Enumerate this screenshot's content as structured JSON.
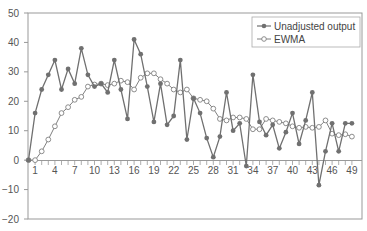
{
  "chart_data": {
    "type": "line",
    "title": "",
    "xlabel": "",
    "ylabel": "",
    "ylim": [
      -20,
      50
    ],
    "xlim": [
      0,
      49
    ],
    "y_ticks": [
      50,
      40,
      30,
      20,
      10,
      0,
      -10,
      -20
    ],
    "x_tick_labels": [
      "1",
      "4",
      "7",
      "10",
      "13",
      "16",
      "19",
      "22",
      "25",
      "28",
      "31",
      "34",
      "37",
      "40",
      "43",
      "46",
      "49"
    ],
    "grid": false,
    "legend_position": "top-right",
    "x": [
      0,
      1,
      2,
      3,
      4,
      5,
      6,
      7,
      8,
      9,
      10,
      11,
      12,
      13,
      14,
      15,
      16,
      17,
      18,
      19,
      20,
      21,
      22,
      23,
      24,
      25,
      26,
      27,
      28,
      29,
      30,
      31,
      32,
      33,
      34,
      35,
      36,
      37,
      38,
      39,
      40,
      41,
      42,
      43,
      44,
      45,
      46,
      47,
      48,
      49
    ],
    "series": [
      {
        "name": "Unadjusted output",
        "marker": "filled-circle",
        "color": "#707070",
        "values": [
          0,
          16,
          24,
          29,
          34,
          24,
          31,
          26,
          38,
          29,
          25,
          26,
          23,
          34,
          24,
          14,
          41,
          36,
          25,
          13,
          26,
          12,
          15,
          34,
          7,
          21,
          16,
          7.5,
          1,
          8,
          23,
          10,
          12.5,
          -2,
          29,
          13,
          8.5,
          12,
          4,
          9.5,
          16,
          5.5,
          13.5,
          23,
          -8.5,
          3,
          12.5,
          3,
          12.5,
          12.5
        ]
      },
      {
        "name": "EWMA",
        "marker": "open-circle",
        "color": "#808080",
        "values": [
          0,
          0,
          3,
          7,
          11.5,
          16,
          18,
          20.5,
          21.5,
          25,
          25.7,
          26,
          25.5,
          26,
          27,
          26.5,
          24,
          28,
          29.5,
          29.5,
          27.5,
          26,
          24,
          23,
          24,
          21,
          20.5,
          20,
          17.5,
          14,
          13.5,
          14.5,
          14.5,
          14,
          10.5,
          10.5,
          14,
          13.5,
          13,
          12.5,
          11.5,
          11,
          11.3,
          11,
          11.3,
          13.5,
          9,
          8.5,
          8.8,
          8
        ]
      }
    ]
  },
  "legend": {
    "items": [
      {
        "label": "Unadjusted output"
      },
      {
        "label": "EWMA"
      }
    ]
  }
}
